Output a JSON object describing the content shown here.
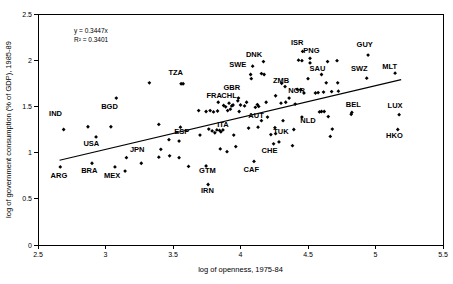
{
  "chart_data": {
    "type": "scatter",
    "title": "",
    "xlabel": "log of openness, 1975-84",
    "ylabel": "log of government consumption (% of GDP), 1985-89",
    "xlim": [
      2.5,
      5.5
    ],
    "ylim": [
      0,
      2.5
    ],
    "xticks": [
      "2.5",
      "3",
      "3.5",
      "4",
      "4.5",
      "5",
      "5.5"
    ],
    "xtick_values": [
      2.5,
      3,
      3.5,
      4,
      4.5,
      5,
      5.5
    ],
    "yticks": [
      "0",
      "0.5",
      "1",
      "1.5",
      "2",
      "2.5"
    ],
    "ytick_values": [
      0,
      0.5,
      1,
      1.5,
      2,
      2.5
    ],
    "grid": false,
    "legend": null,
    "annotations": {
      "equation": "y = 0.3447x",
      "r_squared": "R² = 0.3401"
    },
    "trendline": {
      "type": "linear",
      "slope": 0.3447,
      "r_squared": 0.3401,
      "x_start": 2.66,
      "y_start": 0.917,
      "x_end": 5.19,
      "y_end": 1.789
    },
    "marker_color": "#000000",
    "marker_shape": "diamond",
    "labeled_points": [
      {
        "label": "IND",
        "x": 2.69,
        "y": 1.25,
        "lx": 2.63,
        "ly": 1.4
      },
      {
        "label": "USA",
        "x": 2.93,
        "y": 1.17,
        "lx": 2.895,
        "ly": 1.075
      },
      {
        "label": "ARG",
        "x": 2.665,
        "y": 0.845,
        "lx": 2.655,
        "ly": 0.725
      },
      {
        "label": "BRA",
        "x": 2.9,
        "y": 0.885,
        "lx": 2.88,
        "ly": 0.775
      },
      {
        "label": "MEX",
        "x": 3.07,
        "y": 0.845,
        "lx": 3.05,
        "ly": 0.725
      },
      {
        "label": "BGD",
        "x": 3.08,
        "y": 1.59,
        "lx": 3.03,
        "ly": 1.475
      },
      {
        "label": "JPN",
        "x": 3.265,
        "y": 0.885,
        "lx": 3.235,
        "ly": 1.01
      },
      {
        "label": "TZA",
        "x": 3.575,
        "y": 1.745,
        "lx": 3.52,
        "ly": 1.845
      },
      {
        "label": "ESP",
        "x": 3.545,
        "y": 1.125,
        "lx": 3.565,
        "ly": 1.2
      },
      {
        "label": "GTM",
        "x": 3.745,
        "y": 0.855,
        "lx": 3.755,
        "ly": 0.775
      },
      {
        "label": "IRN",
        "x": 3.76,
        "y": 0.655,
        "lx": 3.755,
        "ly": 0.565
      },
      {
        "label": "FRA",
        "x": 3.835,
        "y": 1.545,
        "lx": 3.805,
        "ly": 1.595
      },
      {
        "label": "CHL",
        "x": 3.945,
        "y": 1.515,
        "lx": 3.915,
        "ly": 1.595
      },
      {
        "label": "ITA",
        "x": 3.87,
        "y": 1.245,
        "lx": 3.87,
        "ly": 1.275
      },
      {
        "label": "GBR",
        "x": 3.985,
        "y": 1.59,
        "lx": 3.935,
        "ly": 1.675
      },
      {
        "label": "SWE",
        "x": 4.08,
        "y": 1.8,
        "lx": 3.98,
        "ly": 1.93
      },
      {
        "label": "DNK",
        "x": 4.17,
        "y": 1.985,
        "lx": 4.1,
        "ly": 2.04
      },
      {
        "label": "AUT",
        "x": 4.155,
        "y": 1.345,
        "lx": 4.115,
        "ly": 1.375
      },
      {
        "label": "CAF",
        "x": 4.1,
        "y": 0.905,
        "lx": 4.08,
        "ly": 0.79
      },
      {
        "label": "CHE",
        "x": 4.245,
        "y": 1.095,
        "lx": 4.215,
        "ly": 1.0
      },
      {
        "label": "TUK",
        "x": 4.285,
        "y": 1.115,
        "lx": 4.3,
        "ly": 1.2
      },
      {
        "label": "ZMB",
        "x": 4.33,
        "y": 1.715,
        "lx": 4.3,
        "ly": 1.755
      },
      {
        "label": "ISR",
        "x": 4.46,
        "y": 2.095,
        "lx": 4.42,
        "ly": 2.165
      },
      {
        "label": "PNG",
        "x": 4.515,
        "y": 2.02,
        "lx": 4.525,
        "ly": 2.075
      },
      {
        "label": "NOR",
        "x": 4.445,
        "y": 1.68,
        "lx": 4.415,
        "ly": 1.645
      },
      {
        "label": "SAU",
        "x": 4.6,
        "y": 1.845,
        "lx": 4.57,
        "ly": 1.885
      },
      {
        "label": "NLD",
        "x": 4.455,
        "y": 1.385,
        "lx": 4.5,
        "ly": 1.325
      },
      {
        "label": "SWZ",
        "x": 4.935,
        "y": 1.805,
        "lx": 4.88,
        "ly": 1.885
      },
      {
        "label": "GUY",
        "x": 4.945,
        "y": 2.055,
        "lx": 4.92,
        "ly": 2.145
      },
      {
        "label": "BEL",
        "x": 4.825,
        "y": 1.435,
        "lx": 4.835,
        "ly": 1.49
      },
      {
        "label": "MLT",
        "x": 5.145,
        "y": 1.86,
        "lx": 5.105,
        "ly": 1.905
      },
      {
        "label": "LUX",
        "x": 5.175,
        "y": 1.41,
        "lx": 5.145,
        "ly": 1.485
      },
      {
        "label": "HKO",
        "x": 5.165,
        "y": 1.25,
        "lx": 5.14,
        "ly": 1.155
      }
    ],
    "unlabeled_points": [
      {
        "x": 2.87,
        "y": 1.28
      },
      {
        "x": 3.04,
        "y": 1.28
      },
      {
        "x": 3.145,
        "y": 0.8
      },
      {
        "x": 3.155,
        "y": 0.945
      },
      {
        "x": 3.325,
        "y": 1.755
      },
      {
        "x": 3.395,
        "y": 1.305
      },
      {
        "x": 3.41,
        "y": 1.035
      },
      {
        "x": 3.395,
        "y": 0.95
      },
      {
        "x": 3.47,
        "y": 1.14
      },
      {
        "x": 3.475,
        "y": 0.965
      },
      {
        "x": 3.545,
        "y": 0.945
      },
      {
        "x": 3.555,
        "y": 1.275
      },
      {
        "x": 3.56,
        "y": 1.745
      },
      {
        "x": 3.615,
        "y": 0.85
      },
      {
        "x": 3.69,
        "y": 1.455
      },
      {
        "x": 3.7,
        "y": 1.19
      },
      {
        "x": 3.745,
        "y": 1.445
      },
      {
        "x": 3.765,
        "y": 1.255
      },
      {
        "x": 3.775,
        "y": 1.455
      },
      {
        "x": 3.79,
        "y": 1.235
      },
      {
        "x": 3.8,
        "y": 1.44
      },
      {
        "x": 3.81,
        "y": 1.215
      },
      {
        "x": 3.825,
        "y": 1.245
      },
      {
        "x": 3.83,
        "y": 1.45
      },
      {
        "x": 3.845,
        "y": 1.24
      },
      {
        "x": 3.85,
        "y": 1.04
      },
      {
        "x": 3.855,
        "y": 1.225
      },
      {
        "x": 3.875,
        "y": 1.51
      },
      {
        "x": 3.89,
        "y": 1.495
      },
      {
        "x": 3.9,
        "y": 1.01
      },
      {
        "x": 3.905,
        "y": 1.455
      },
      {
        "x": 3.915,
        "y": 1.535
      },
      {
        "x": 3.925,
        "y": 1.47
      },
      {
        "x": 3.935,
        "y": 1.505
      },
      {
        "x": 3.95,
        "y": 1.19
      },
      {
        "x": 3.965,
        "y": 1.065
      },
      {
        "x": 3.99,
        "y": 1.445
      },
      {
        "x": 4.0,
        "y": 1.515
      },
      {
        "x": 4.03,
        "y": 1.505
      },
      {
        "x": 4.045,
        "y": 1.545
      },
      {
        "x": 4.06,
        "y": 1.265
      },
      {
        "x": 4.075,
        "y": 1.845
      },
      {
        "x": 4.09,
        "y": 1.935
      },
      {
        "x": 4.11,
        "y": 1.49
      },
      {
        "x": 4.125,
        "y": 1.52
      },
      {
        "x": 4.13,
        "y": 1.275
      },
      {
        "x": 4.155,
        "y": 1.855
      },
      {
        "x": 4.175,
        "y": 1.845
      },
      {
        "x": 4.19,
        "y": 1.545
      },
      {
        "x": 4.2,
        "y": 1.385
      },
      {
        "x": 4.225,
        "y": 1.195
      },
      {
        "x": 4.26,
        "y": 1.615
      },
      {
        "x": 4.305,
        "y": 1.75
      },
      {
        "x": 4.315,
        "y": 1.345
      },
      {
        "x": 4.335,
        "y": 1.545
      },
      {
        "x": 4.36,
        "y": 1.59
      },
      {
        "x": 4.385,
        "y": 1.075
      },
      {
        "x": 4.395,
        "y": 1.25
      },
      {
        "x": 4.405,
        "y": 1.525
      },
      {
        "x": 4.42,
        "y": 1.685
      },
      {
        "x": 4.43,
        "y": 2.0
      },
      {
        "x": 4.455,
        "y": 1.995
      },
      {
        "x": 4.47,
        "y": 1.645
      },
      {
        "x": 4.5,
        "y": 1.8
      },
      {
        "x": 4.515,
        "y": 1.97
      },
      {
        "x": 4.555,
        "y": 1.645
      },
      {
        "x": 4.575,
        "y": 1.65
      },
      {
        "x": 4.585,
        "y": 1.44
      },
      {
        "x": 4.6,
        "y": 1.445
      },
      {
        "x": 4.615,
        "y": 1.655
      },
      {
        "x": 4.62,
        "y": 1.445
      },
      {
        "x": 4.635,
        "y": 1.755
      },
      {
        "x": 4.645,
        "y": 1.985
      },
      {
        "x": 4.65,
        "y": 1.39
      },
      {
        "x": 4.665,
        "y": 1.175
      },
      {
        "x": 4.675,
        "y": 1.66
      },
      {
        "x": 4.68,
        "y": 1.255
      },
      {
        "x": 4.715,
        "y": 1.995
      },
      {
        "x": 4.72,
        "y": 1.755
      },
      {
        "x": 4.725,
        "y": 1.665
      },
      {
        "x": 4.82,
        "y": 1.415
      },
      {
        "x": 4.26,
        "y": 1.205
      },
      {
        "x": 4.135,
        "y": 1.5
      },
      {
        "x": 3.98,
        "y": 1.56
      },
      {
        "x": 4.255,
        "y": 1.27
      },
      {
        "x": 4.3,
        "y": 1.535
      }
    ]
  },
  "axes": {
    "x_title": "log of openness, 1975-84",
    "y_title": "log of government consumption (% of GDP), 1985-89"
  }
}
